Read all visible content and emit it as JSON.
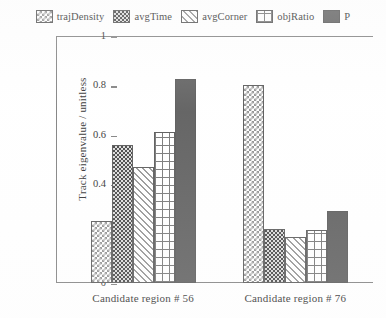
{
  "chart_data": {
    "type": "bar",
    "title": "",
    "xlabel": "",
    "ylabel": "Track eigenvalue / unitless",
    "ylim": [
      0,
      1
    ],
    "ytick_labels": [
      "0",
      "0.2",
      "0.4",
      "0.6",
      "0.8",
      "1"
    ],
    "ytick_values": [
      0,
      0.2,
      0.4,
      0.6,
      0.8,
      1
    ],
    "grid": false,
    "legend_position": "top",
    "categories": [
      "Candidate region # 56",
      "Candidate region # 76"
    ],
    "series": [
      {
        "name": "trajDensity",
        "pattern": "light-checkerboard",
        "values": [
          0.25,
          0.8
        ]
      },
      {
        "name": "avgTime",
        "pattern": "dark-checkerboard",
        "values": [
          0.56,
          0.22
        ]
      },
      {
        "name": "avgCorner",
        "pattern": "diagonal-hatch",
        "values": [
          0.47,
          0.185
        ]
      },
      {
        "name": "objRatio",
        "pattern": "crosshatch-grid",
        "values": [
          0.61,
          0.215
        ]
      },
      {
        "name": "P",
        "pattern": "solid-dark-gray",
        "values": [
          0.825,
          0.29
        ]
      }
    ]
  },
  "colors": {
    "axis": "#7a7a7a",
    "text": "#262626",
    "bar_outline": "#4f4f4f",
    "solid_series": "#555555",
    "background": "#ffffff"
  }
}
